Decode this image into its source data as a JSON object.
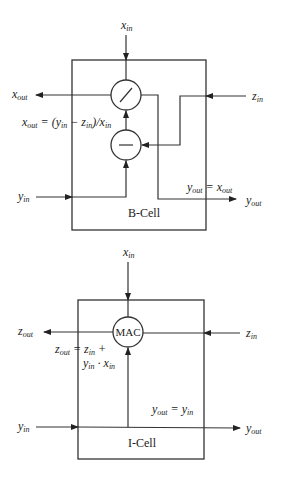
{
  "b_cell": {
    "title": "B-Cell",
    "operators": {
      "top": "divide",
      "bottom": "subtract"
    },
    "inputs": {
      "x_in": {
        "base": "x",
        "sub": "in"
      },
      "y_in": {
        "base": "y",
        "sub": "in"
      },
      "z_in": {
        "base": "z",
        "sub": "in"
      }
    },
    "outputs": {
      "x_out": {
        "base": "x",
        "sub": "out"
      },
      "y_out": {
        "base": "y",
        "sub": "out"
      }
    },
    "equations": {
      "x_out": "x_out = (y_in − z_in)/x_in",
      "y_out": "y_out = x_out"
    }
  },
  "i_cell": {
    "title": "I-Cell",
    "operator_label": "MAC",
    "inputs": {
      "x_in": {
        "base": "x",
        "sub": "in"
      },
      "y_in": {
        "base": "y",
        "sub": "in"
      },
      "z_in": {
        "base": "z",
        "sub": "in"
      }
    },
    "outputs": {
      "z_out": {
        "base": "z",
        "sub": "out"
      },
      "y_out": {
        "base": "y",
        "sub": "out"
      }
    },
    "equations": {
      "z_out_line1": "z_out = z_in +",
      "z_out_line2": "y_in · x_in",
      "y_out": "y_out = y_in"
    }
  },
  "common": {
    "in": "in",
    "out": "out",
    "x": "x",
    "y": "y",
    "z": "z",
    "eq": " = ",
    "plus": " +",
    "dot": " · ",
    "slash": ")/",
    "open_paren": "(",
    "minus": " − "
  }
}
